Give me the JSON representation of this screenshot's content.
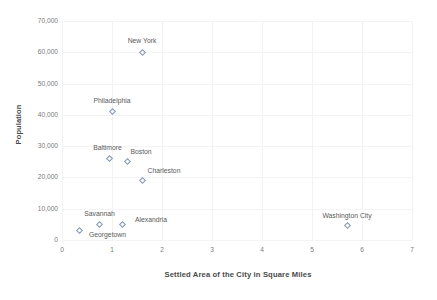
{
  "chart_data": {
    "type": "scatter",
    "title": "",
    "xlabel": "Settled Area of the City in Square Miles",
    "ylabel": "Population",
    "xlim": [
      0,
      7
    ],
    "ylim": [
      0,
      70000
    ],
    "grid": true,
    "legend": "none",
    "x_ticks": [
      "0",
      "1",
      "2",
      "3",
      "4",
      "5",
      "6",
      "7"
    ],
    "y_ticks": [
      "0",
      "10,000",
      "20,000",
      "30,000",
      "40,000",
      "50,000",
      "60,000",
      "70,000"
    ],
    "marker_color": "#8497b0",
    "points": [
      {
        "label": "New York",
        "x": 1.6,
        "y": 60000,
        "label_dx": 0,
        "label_dy": -11
      },
      {
        "label": "Philadelphia",
        "x": 1.0,
        "y": 41000,
        "label_dx": 0,
        "label_dy": -11
      },
      {
        "label": "Baltimore",
        "x": 0.95,
        "y": 26000,
        "label_dx": -2,
        "label_dy": -11
      },
      {
        "label": "Boston",
        "x": 1.3,
        "y": 25000,
        "label_dx": 14,
        "label_dy": -10
      },
      {
        "label": "Charleston",
        "x": 1.6,
        "y": 19000,
        "label_dx": 22,
        "label_dy": -10
      },
      {
        "label": "Savannah",
        "x": 0.75,
        "y": 5000,
        "label_dx": 0,
        "label_dy": -10
      },
      {
        "label": "Alexandria",
        "x": 1.2,
        "y": 5000,
        "label_dx": 29,
        "label_dy": -4
      },
      {
        "label": "Georgetown",
        "x": 0.35,
        "y": 3000,
        "label_dx": 28,
        "label_dy": 4
      },
      {
        "label": "Washington City",
        "x": 5.7,
        "y": 4500,
        "label_dx": 0,
        "label_dy": -10
      }
    ]
  }
}
